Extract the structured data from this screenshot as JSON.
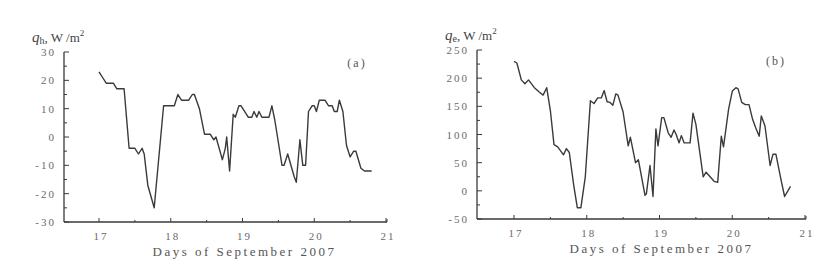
{
  "chart_data": [
    {
      "id": "a",
      "type": "line",
      "panel_label": "(a)",
      "ylabel_symbol": "q",
      "ylabel_subscript": "h",
      "ylabel_units": ", W /m",
      "ylabel_sup": "2",
      "xlabel": "Days of September 2007",
      "xlim": [
        16.5,
        21
      ],
      "ylim": [
        -30,
        30
      ],
      "xticks": [
        17,
        18,
        19,
        20,
        21
      ],
      "yticks": [
        30,
        20,
        10,
        0,
        -10,
        -20,
        -30
      ],
      "grid": false,
      "legend": null,
      "series": [
        {
          "name": "q_h",
          "color": "#3a3a3a",
          "x": [
            17.0,
            17.05,
            17.1,
            17.2,
            17.25,
            17.35,
            17.42,
            17.5,
            17.55,
            17.6,
            17.63,
            17.68,
            17.77,
            17.9,
            18.05,
            18.1,
            18.15,
            18.25,
            18.3,
            18.33,
            18.4,
            18.47,
            18.55,
            18.6,
            18.63,
            18.72,
            18.76,
            18.78,
            18.82,
            18.87,
            18.9,
            18.95,
            18.98,
            19.08,
            19.13,
            19.16,
            19.2,
            19.23,
            19.27,
            19.37,
            19.41,
            19.45,
            19.55,
            19.58,
            19.63,
            19.72,
            19.75,
            19.8,
            19.84,
            19.88,
            19.92,
            19.97,
            20.0,
            20.03,
            20.07,
            20.15,
            20.2,
            20.25,
            20.28,
            20.32,
            20.35,
            20.4,
            20.45,
            20.5,
            20.55,
            20.58,
            20.65,
            20.7,
            20.8
          ],
          "values": [
            23,
            21,
            19,
            19,
            17,
            17,
            -4,
            -4,
            -6,
            -4,
            -6,
            -17,
            -25,
            11,
            11,
            15,
            13,
            13,
            15,
            15,
            10,
            1,
            1,
            -1,
            0,
            -8,
            -4,
            0,
            -12,
            8,
            7,
            11,
            11,
            7,
            7,
            9,
            7,
            9,
            7,
            7,
            11,
            6,
            -10,
            -10,
            -6,
            -14,
            -16,
            -1,
            -10,
            -10,
            9,
            11,
            11,
            9,
            13,
            13,
            11,
            11,
            9,
            9,
            13,
            9,
            -3,
            -7,
            -5,
            -5,
            -11,
            -12,
            -12
          ]
        }
      ]
    },
    {
      "id": "b",
      "type": "line",
      "panel_label": "(b)",
      "ylabel_symbol": "q",
      "ylabel_subscript": "e",
      "ylabel_units": ", W /m",
      "ylabel_sup": "2",
      "xlabel": "Days of September 2007",
      "xlim": [
        16.5,
        21
      ],
      "ylim": [
        -50,
        250
      ],
      "xticks": [
        17,
        18,
        19,
        20,
        21
      ],
      "yticks": [
        250,
        200,
        150,
        100,
        50,
        0,
        -50
      ],
      "grid": false,
      "legend": null,
      "series": [
        {
          "name": "q_e",
          "color": "#3a3a3a",
          "x": [
            17.0,
            17.04,
            17.1,
            17.15,
            17.2,
            17.28,
            17.35,
            17.4,
            17.45,
            17.5,
            17.55,
            17.6,
            17.68,
            17.72,
            17.76,
            17.82,
            17.87,
            17.92,
            17.98,
            18.05,
            18.1,
            18.15,
            18.2,
            18.24,
            18.28,
            18.32,
            18.36,
            18.4,
            18.43,
            18.5,
            18.57,
            18.6,
            18.67,
            18.71,
            18.8,
            18.82,
            18.87,
            18.91,
            18.95,
            18.98,
            19.03,
            19.06,
            19.12,
            19.16,
            19.2,
            19.23,
            19.27,
            19.3,
            19.34,
            19.42,
            19.46,
            19.5,
            19.6,
            19.64,
            19.75,
            19.8,
            19.85,
            19.88,
            19.95,
            20.0,
            20.05,
            20.08,
            20.13,
            20.18,
            20.23,
            20.28,
            20.32,
            20.37,
            20.4,
            20.45,
            20.52,
            20.56,
            20.6,
            20.67,
            20.72,
            20.8
          ],
          "values": [
            230,
            227,
            197,
            190,
            197,
            183,
            175,
            170,
            183,
            142,
            82,
            78,
            64,
            75,
            68,
            10,
            -30,
            -30,
            25,
            160,
            155,
            165,
            165,
            178,
            158,
            157,
            152,
            172,
            170,
            140,
            80,
            95,
            50,
            55,
            -8,
            -5,
            45,
            -10,
            110,
            80,
            130,
            130,
            103,
            95,
            108,
            100,
            85,
            98,
            85,
            85,
            138,
            118,
            25,
            33,
            17,
            15,
            97,
            78,
            145,
            177,
            183,
            181,
            157,
            153,
            153,
            127,
            113,
            97,
            133,
            115,
            45,
            65,
            65,
            20,
            -10,
            8
          ]
        }
      ]
    }
  ],
  "layout": {
    "a": {
      "axis_x": 64,
      "plot_top": 52,
      "plot_bottom": 222,
      "x17": 99,
      "x21": 386,
      "right_end": 387
    },
    "b": {
      "axis_x": 62,
      "plot_top": 50,
      "plot_bottom": 219,
      "x17": 99,
      "x21": 390,
      "right_end": 391
    }
  }
}
